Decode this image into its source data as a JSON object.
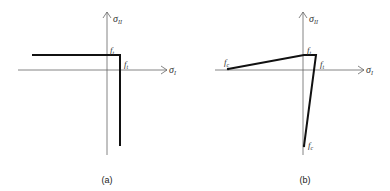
{
  "panels": [
    {
      "id": "a",
      "caption": "(a)",
      "axes": {
        "x_label": "σ",
        "x_sub": "I",
        "y_label": "σ",
        "y_sub": "II"
      },
      "labels": {
        "top": "f",
        "top_sub": "t",
        "right": "f",
        "right_sub": "t"
      },
      "description": "Rectangular tension cut-off: horizontal line at σII = ft and vertical line at σI = ft"
    },
    {
      "id": "b",
      "caption": "(b)",
      "axes": {
        "x_label": "σ",
        "x_sub": "I",
        "y_label": "σ",
        "y_sub": "II"
      },
      "labels": {
        "top": "f",
        "top_sub": "t",
        "right": "f",
        "right_sub": "t",
        "left": "f",
        "left_sub": "c",
        "bottom": "f",
        "bottom_sub": "c"
      },
      "description": "Failure envelope linking fc on σI axis to ft on σII axis, and ft on σI axis to fc on σII axis"
    }
  ],
  "colors": {
    "axis": "#666666",
    "curve": "#111111",
    "background": "#ffffff"
  }
}
